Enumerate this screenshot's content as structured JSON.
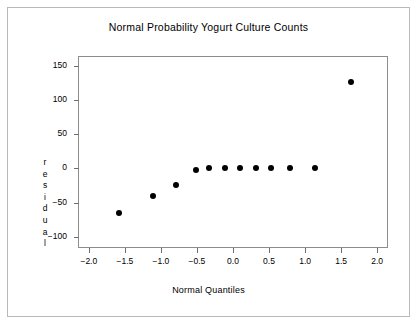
{
  "chart_data": {
    "type": "scatter",
    "title": "Normal Probability Yogurt Culture Counts",
    "xlabel": "Normal Quantiles",
    "ylabel": "residual",
    "ylabel_chars": [
      "r",
      "e",
      "s",
      "i",
      "d",
      "u",
      "a",
      "l"
    ],
    "xlim": [
      -2.15,
      2.15
    ],
    "ylim": [
      -118,
      163
    ],
    "xticks": [
      -2.0,
      -1.5,
      -1.0,
      -0.5,
      0.0,
      0.5,
      1.0,
      1.5,
      2.0
    ],
    "xticklabels": [
      "-2.0",
      "-1.5",
      "-1.0",
      "-0.5",
      "0.0",
      "0.5",
      "1.0",
      "1.5",
      "2.0"
    ],
    "yticks": [
      -100,
      -50,
      0,
      50,
      100,
      150
    ],
    "yticklabels": [
      "-100",
      "-50",
      "0",
      "50",
      "100",
      "150"
    ],
    "grid": false,
    "legend": false,
    "marker": "filled-circle",
    "marker_color": "#000000",
    "x": [
      -1.6,
      -1.12,
      -0.8,
      -0.53,
      -0.34,
      -0.13,
      0.09,
      0.3,
      0.52,
      0.77,
      1.12,
      1.62
    ],
    "y": [
      -65,
      -40,
      -24,
      -3,
      0,
      0,
      0,
      1,
      1,
      1,
      1,
      127
    ],
    "points": [
      {
        "x": -1.6,
        "y": -65
      },
      {
        "x": -1.12,
        "y": -40
      },
      {
        "x": -0.8,
        "y": -24
      },
      {
        "x": -0.53,
        "y": -3
      },
      {
        "x": -0.34,
        "y": 0
      },
      {
        "x": -0.13,
        "y": 0
      },
      {
        "x": 0.09,
        "y": 0
      },
      {
        "x": 0.3,
        "y": 1
      },
      {
        "x": 0.52,
        "y": 1
      },
      {
        "x": 0.77,
        "y": 1
      },
      {
        "x": 1.12,
        "y": 1
      },
      {
        "x": 1.62,
        "y": 127
      }
    ]
  },
  "colors": {
    "background": "#ffffff",
    "frame": "#b9b9b9",
    "axis": "#8d8d8d",
    "text": "#000000",
    "marker": "#000000"
  }
}
